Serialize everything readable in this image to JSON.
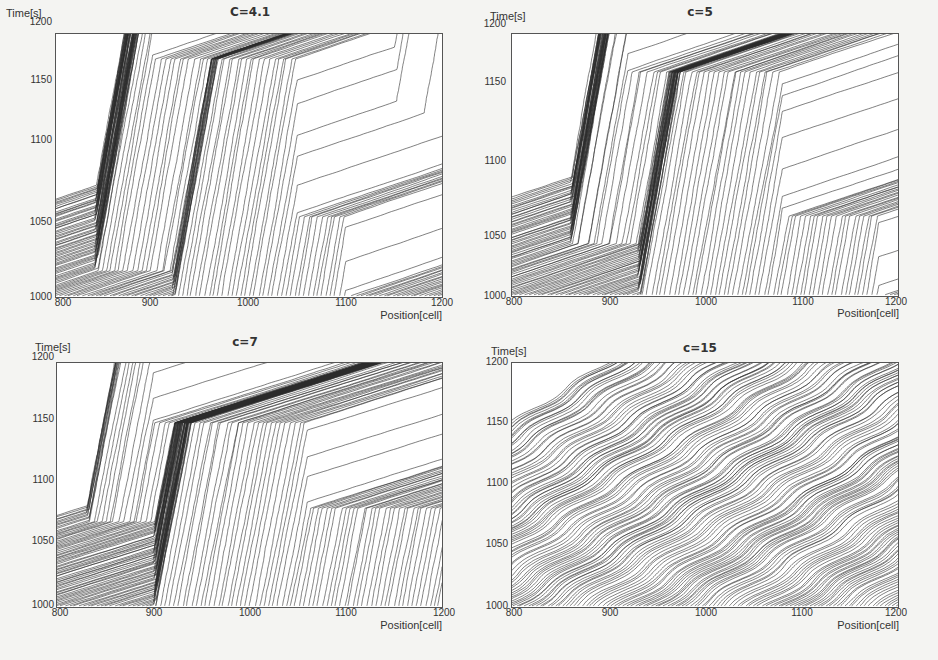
{
  "figure": {
    "background": "#f4f4f2",
    "line_color": "#2b2b2b"
  },
  "chart_data": [
    {
      "type": "line",
      "title": "C=4.1",
      "xlabel": "Position[cell]",
      "ylabel": "Time[s]",
      "xlim": [
        800,
        1200
      ],
      "ylim": [
        1000,
        1200
      ],
      "xticks": [
        "800",
        "900",
        "1000",
        "1100",
        "1200"
      ],
      "yticks": [
        "1000",
        "1050",
        "1100",
        "1150",
        "1200"
      ],
      "description": "Space-time vehicle trajectories; a wide jam region with near-horizontal (stopped) trajectories spanning ~810-1070 cells upstream-propagating, free-flow steep trajectories to the right (~1050-1200) and at left edge.",
      "jam_regions": [
        {
          "x_start": 800,
          "x_end": 900,
          "t_start": 1125,
          "t_end": 1200
        },
        {
          "x_start": 840,
          "x_end": 1050,
          "t_start": 1020,
          "t_end": 1180
        },
        {
          "x_start": 920,
          "x_end": 1100,
          "t_start": 1000,
          "t_end": 1060
        },
        {
          "x_start": 1150,
          "x_end": 1200,
          "t_start": 1140,
          "t_end": 1200
        }
      ]
    },
    {
      "type": "line",
      "title": "c=5",
      "xlabel": "Position[cell]",
      "ylabel": "Time[s]",
      "xlim": [
        800,
        1200
      ],
      "ylim": [
        1000,
        1200
      ],
      "xticks": [
        "800",
        "900",
        "1000",
        "1100",
        "1200"
      ],
      "yticks": [
        "1000",
        "1050",
        "1100",
        "1150",
        "1200"
      ],
      "description": "Jam region with stop-and-go waves propagating upstream, boundary tilting from ~(860,1000) up to ~(1080,1130); free-flow region in upper right.",
      "jam_regions": [
        {
          "x_start": 800,
          "x_end": 920,
          "t_start": 1150,
          "t_end": 1200
        },
        {
          "x_start": 860,
          "x_end": 1080,
          "t_start": 1040,
          "t_end": 1170
        },
        {
          "x_start": 930,
          "x_end": 1180,
          "t_start": 1000,
          "t_end": 1060
        }
      ]
    },
    {
      "type": "line",
      "title": "c=7",
      "xlabel": "Position[cell]",
      "ylabel": "Time[s]",
      "xlim": [
        800,
        1200
      ],
      "ylim": [
        1000,
        1200
      ],
      "xticks": [
        "800",
        "900",
        "1000",
        "1100",
        "1200"
      ],
      "yticks": [
        "1000",
        "1050",
        "1100",
        "1150",
        "1200"
      ],
      "description": "Multiple narrow jam bands propagating backward (upstream) across the domain with free-flow between; dense free-flow region at lower-left.",
      "jam_regions": [
        {
          "x_start": 800,
          "x_end": 900,
          "t_start": 1150,
          "t_end": 1200
        },
        {
          "x_start": 830,
          "x_end": 1060,
          "t_start": 1070,
          "t_end": 1150
        },
        {
          "x_start": 900,
          "x_end": 1200,
          "t_start": 1000,
          "t_end": 1080
        }
      ]
    },
    {
      "type": "line",
      "title": "c=15",
      "xlabel": "Position[cell]",
      "ylabel": "Time[s]",
      "xlim": [
        800,
        1200
      ],
      "ylim": [
        1000,
        1200
      ],
      "xticks": [
        "800",
        "900",
        "1000",
        "1100",
        "1200"
      ],
      "yticks": [
        "1000",
        "1050",
        "1100",
        "1150",
        "1200"
      ],
      "description": "Homogeneous congested flow with many small stop-and-go waves; trajectories mostly shallow diagonal throughout.",
      "jam_regions": []
    }
  ],
  "panels": [
    {
      "title": "C=4.1",
      "ylabel": "Time[s]",
      "xlabel": "Position[cell]",
      "yticks": [
        "1200",
        "1150",
        "1100",
        "1050",
        "1000"
      ],
      "xticks": [
        "800",
        "900",
        "1000",
        "1100",
        "1200"
      ]
    },
    {
      "title": "c=5",
      "ylabel": "Time[s]",
      "xlabel": "Position[cell]",
      "yticks": [
        "1200",
        "1150",
        "1100",
        "1050",
        "1000"
      ],
      "xticks": [
        "800",
        "900",
        "1000",
        "1100",
        "1200"
      ]
    },
    {
      "title": "c=7",
      "ylabel": "Time[s]",
      "xlabel": "Position[cell]",
      "yticks": [
        "1200",
        "1150",
        "1100",
        "1050",
        "1000"
      ],
      "xticks": [
        "800",
        "900",
        "1000",
        "1100",
        "1200"
      ]
    },
    {
      "title": "c=15",
      "ylabel": "Time[s]",
      "xlabel": "Position[cell]",
      "yticks": [
        "1200",
        "1150",
        "1100",
        "1050",
        "1000"
      ],
      "xticks": [
        "800",
        "900",
        "1000",
        "1100",
        "1200"
      ]
    }
  ]
}
